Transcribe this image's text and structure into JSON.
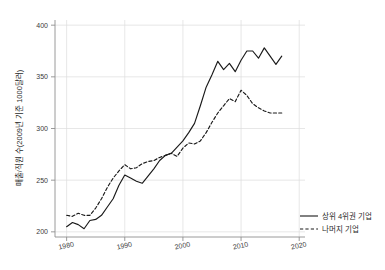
{
  "chart_data": {
    "type": "line",
    "title": "",
    "xlabel": "",
    "ylabel": "매출/직원 수(2009년 기준 1000달러)",
    "xlim": [
      1978,
      2021
    ],
    "ylim": [
      195,
      405
    ],
    "xticks": [
      1980,
      1990,
      2000,
      2010,
      2020
    ],
    "yticks": [
      200,
      250,
      300,
      350,
      400
    ],
    "grid": true,
    "legend_position": "right-outside",
    "x": [
      1980,
      1981,
      1982,
      1983,
      1984,
      1985,
      1986,
      1987,
      1988,
      1989,
      1990,
      1991,
      1992,
      1993,
      1994,
      1995,
      1996,
      1997,
      1998,
      1999,
      2000,
      2001,
      2002,
      2003,
      2004,
      2005,
      2006,
      2007,
      2008,
      2009,
      2010,
      2011,
      2012,
      2013,
      2014,
      2015,
      2016,
      2017
    ],
    "series": [
      {
        "name": "상위 4위권 기업",
        "style": "solid",
        "color": "#1a1a1a",
        "values": [
          205,
          209,
          207,
          203,
          211,
          212,
          216,
          224,
          232,
          245,
          255,
          252,
          249,
          247,
          254,
          261,
          269,
          274,
          276,
          282,
          288,
          296,
          305,
          322,
          340,
          352,
          365,
          357,
          363,
          355,
          366,
          375,
          375,
          368,
          378,
          370,
          362,
          370
        ]
      },
      {
        "name": "나머지 기업",
        "style": "dashed",
        "color": "#1a1a1a",
        "values": [
          216,
          215,
          218,
          216,
          216,
          223,
          232,
          243,
          252,
          259,
          265,
          261,
          262,
          266,
          268,
          269,
          272,
          274,
          276,
          273,
          281,
          286,
          285,
          288,
          296,
          306,
          315,
          322,
          329,
          326,
          337,
          332,
          324,
          320,
          317,
          315,
          315,
          315
        ]
      }
    ]
  },
  "axis": {
    "y_tick_labels": [
      "400",
      "350",
      "300",
      "250",
      "200"
    ],
    "x_tick_labels": [
      "1980",
      "1990",
      "2000",
      "2010",
      "2020"
    ],
    "y_axis_title": "매출/직원 수(2009년 기준 1000달러)"
  },
  "legend": {
    "items": [
      {
        "label": "상위 4위권 기업",
        "style": "solid"
      },
      {
        "label": "나머지 기업",
        "style": "dashed"
      }
    ]
  },
  "colors": {
    "line": "#1a1a1a",
    "grid": "#dcdcdc",
    "axis": "#9a9a9a",
    "text": "#2b2b2b",
    "background": "#ffffff"
  }
}
